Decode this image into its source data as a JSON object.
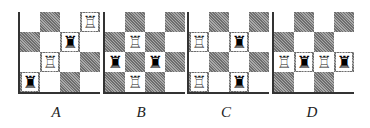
{
  "figure": {
    "boards": [
      {
        "label": "A",
        "size": 4,
        "dark_squares": [
          [
            0,
            1
          ],
          [
            0,
            3
          ],
          [
            1,
            0
          ],
          [
            1,
            2
          ],
          [
            2,
            1
          ],
          [
            2,
            3
          ],
          [
            3,
            0
          ],
          [
            3,
            2
          ]
        ],
        "pieces": [
          {
            "row": 0,
            "col": 3,
            "type": "rook",
            "color": "white"
          },
          {
            "row": 1,
            "col": 2,
            "type": "rook",
            "color": "black"
          },
          {
            "row": 2,
            "col": 1,
            "type": "rook",
            "color": "white"
          },
          {
            "row": 3,
            "col": 0,
            "type": "rook",
            "color": "black"
          }
        ]
      },
      {
        "label": "B",
        "size": 4,
        "dark_squares": [
          [
            0,
            1
          ],
          [
            0,
            3
          ],
          [
            1,
            0
          ],
          [
            1,
            2
          ],
          [
            2,
            1
          ],
          [
            2,
            3
          ],
          [
            3,
            0
          ],
          [
            3,
            2
          ]
        ],
        "pieces": [
          {
            "row": 1,
            "col": 1,
            "type": "rook",
            "color": "white"
          },
          {
            "row": 2,
            "col": 0,
            "type": "rook",
            "color": "black"
          },
          {
            "row": 2,
            "col": 2,
            "type": "rook",
            "color": "black"
          },
          {
            "row": 3,
            "col": 1,
            "type": "rook",
            "color": "white"
          }
        ]
      },
      {
        "label": "C",
        "size": 4,
        "dark_squares": [
          [
            0,
            1
          ],
          [
            0,
            3
          ],
          [
            1,
            0
          ],
          [
            1,
            2
          ],
          [
            2,
            1
          ],
          [
            2,
            3
          ],
          [
            3,
            0
          ],
          [
            3,
            2
          ]
        ],
        "pieces": [
          {
            "row": 1,
            "col": 0,
            "type": "rook",
            "color": "white"
          },
          {
            "row": 1,
            "col": 2,
            "type": "rook",
            "color": "black"
          },
          {
            "row": 3,
            "col": 0,
            "type": "rook",
            "color": "white"
          },
          {
            "row": 3,
            "col": 2,
            "type": "rook",
            "color": "black"
          }
        ]
      },
      {
        "label": "D",
        "size": 4,
        "dark_squares": [
          [
            0,
            1
          ],
          [
            0,
            3
          ],
          [
            1,
            0
          ],
          [
            1,
            2
          ],
          [
            2,
            1
          ],
          [
            2,
            3
          ],
          [
            3,
            0
          ],
          [
            3,
            2
          ]
        ],
        "pieces": [
          {
            "row": 2,
            "col": 0,
            "type": "rook",
            "color": "white"
          },
          {
            "row": 2,
            "col": 1,
            "type": "rook",
            "color": "black"
          },
          {
            "row": 2,
            "col": 2,
            "type": "rook",
            "color": "white"
          },
          {
            "row": 2,
            "col": 3,
            "type": "rook",
            "color": "black"
          }
        ]
      }
    ],
    "icons": {
      "white_rook": "♖",
      "black_rook": "♜"
    }
  }
}
